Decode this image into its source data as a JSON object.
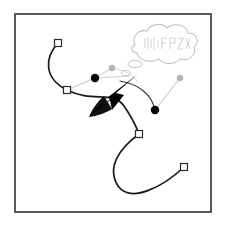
{
  "figure": {
    "title": "Bezier path editing illustration",
    "canvas": {
      "width": 225,
      "height": 235,
      "background_color": "#ffffff"
    },
    "frame": {
      "name": "illustration-border",
      "x": 15,
      "y": 14,
      "width": 196,
      "height": 198,
      "stroke_color": "#5a5a5a",
      "fill_color": "#ffffff",
      "stroke_width": 2
    },
    "colors": {
      "path_stroke": "#1a1a1a",
      "handle_line": "#c9c9c9",
      "anchor_fill": "#ffffff",
      "anchor_stroke": "#2b2b2b",
      "control_point_selected": "#000000",
      "control_point_unselected": "#b5b5b5",
      "cursor_fill": "#000000",
      "bubble_stroke": "#bdbdbd",
      "bubble_fill": "#ffffff",
      "bubble_text": "#cfcfcf"
    },
    "paths": [
      {
        "name": "upper-bezier-path",
        "d": "M 58 43 C 46 58 44 78 67 90 C 92 103 112 90 124 106 C 131 116 136 126 139 134",
        "stroke": "#1a1a1a",
        "stroke_width": 1.6
      },
      {
        "name": "lower-bezier-path",
        "d": "M 139 134 C 121 147 107 166 118 185 C 130 203 163 186 184 167",
        "stroke": "#1a1a1a",
        "stroke_width": 1.6
      },
      {
        "name": "upper-right-curve-segment",
        "d": "M 124 83 C 140 85 152 95 155 110",
        "stroke": "#3d3d3d",
        "stroke_width": 1.2
      }
    ],
    "handle_lines": [
      {
        "name": "handle-line-left-upper",
        "x1": 67,
        "y1": 90,
        "x2": 95,
        "y2": 78
      },
      {
        "name": "handle-line-left-outer",
        "x1": 95,
        "y1": 78,
        "x2": 112,
        "y2": 68
      },
      {
        "name": "handle-line-mid-upper",
        "x1": 95,
        "y1": 78,
        "x2": 129,
        "y2": 76
      },
      {
        "name": "handle-line-right-lower",
        "x1": 155,
        "y1": 110,
        "x2": 180,
        "y2": 78
      }
    ],
    "anchors": [
      {
        "name": "anchor-point-top-left",
        "label": "anchor 1",
        "x": 58,
        "y": 43,
        "size": 7
      },
      {
        "name": "anchor-point-mid-left",
        "label": "anchor 2",
        "x": 67,
        "y": 90,
        "size": 7
      },
      {
        "name": "anchor-point-center",
        "label": "anchor 3",
        "x": 139,
        "y": 134,
        "size": 7
      },
      {
        "name": "anchor-point-bottom-right",
        "label": "anchor 4",
        "x": 184,
        "y": 167,
        "size": 7
      }
    ],
    "control_points": [
      {
        "name": "control-point-selected-left",
        "label": "control handle 1",
        "x": 95,
        "y": 78,
        "r": 4.2,
        "state": "selected"
      },
      {
        "name": "control-point-selected-right",
        "label": "control handle 2",
        "x": 155,
        "y": 110,
        "r": 4.2,
        "state": "selected"
      },
      {
        "name": "control-point-unselected-upper",
        "label": "control handle 3",
        "x": 112,
        "y": 68,
        "r": 3.2,
        "state": "unselected"
      },
      {
        "name": "control-point-unselected-far-right",
        "label": "control handle 4",
        "x": 180,
        "y": 78,
        "r": 3.2,
        "state": "unselected"
      }
    ],
    "cursor": {
      "name": "mouse-cursor-arrow",
      "label": "pointer",
      "tip_x": 112,
      "tip_y": 110,
      "fill": "#000000"
    },
    "thought_bubble": {
      "name": "thought-bubble",
      "label": "thought bubble",
      "text": "∿∿∿∿∿",
      "text_note": "illegible scribbled handwriting",
      "center_x": 160,
      "center_y": 45,
      "width": 66,
      "height": 30,
      "tails": [
        {
          "name": "thought-bubble-tail-large",
          "cx": 135,
          "cy": 64,
          "rx": 7,
          "ry": 3.6
        },
        {
          "name": "thought-bubble-tail-small",
          "cx": 126,
          "cy": 73,
          "rx": 4.5,
          "ry": 2.6
        }
      ]
    }
  }
}
